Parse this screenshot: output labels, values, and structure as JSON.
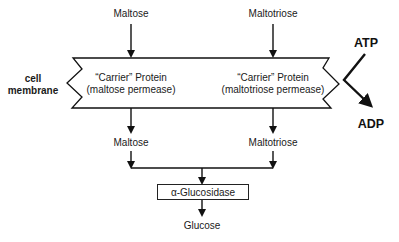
{
  "diagram": {
    "inputs": {
      "left": "Maltose",
      "right": "Maltotriose"
    },
    "membrane": {
      "label_line1": "cell",
      "label_line2": "membrane",
      "carriers": [
        {
          "line1": "“Carrier” Protein",
          "line2": "(maltose permease)"
        },
        {
          "line1": "“Carrier” Protein",
          "line2": "(maltotriose permease)"
        }
      ]
    },
    "energy": {
      "input": "ATP",
      "output": "ADP"
    },
    "inside": {
      "left": "Maltose",
      "right": "Maltotriose"
    },
    "enzyme": {
      "label": "α-Glucosidase"
    },
    "product": {
      "label": "Glucose"
    },
    "colors": {
      "line": "#111111",
      "text": "#1a1a1a",
      "background": "#ffffff"
    }
  }
}
